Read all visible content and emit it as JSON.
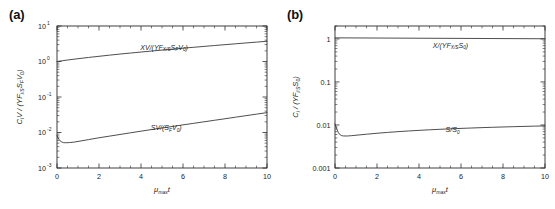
{
  "figure": {
    "panels": [
      {
        "id": "a",
        "label": "(a)",
        "xlabel_main": "μ",
        "xlabel_sub": "max",
        "xlabel_tail": "t",
        "ylabel": "C V / (YF   S V )",
        "xticks": [
          "0",
          "2",
          "4",
          "6",
          "8",
          "10"
        ],
        "yticks": [
          "10",
          "10",
          "10",
          "10",
          "10"
        ],
        "ytick_exponents": [
          "1",
          "0",
          "-1",
          "-2",
          "-3"
        ],
        "curve_labels": [
          "XV/(YF",
          "SV/(S"
        ]
      },
      {
        "id": "b",
        "label": "(b)",
        "xlabel_main": "μ",
        "xlabel_sub": "max",
        "xlabel_tail": "t",
        "ylabel": "C / (YF   S )",
        "xticks": [
          "0",
          "2",
          "4",
          "6",
          "8",
          "10"
        ],
        "yticks": [
          "1",
          "0.1",
          "0.01",
          "0.001"
        ],
        "curve_labels": [
          "X/(YF",
          "S/S"
        ]
      }
    ]
  },
  "chart_data": [
    {
      "type": "line",
      "panel": "a",
      "title": "(a)",
      "xlabel": "μ_max t",
      "ylabel": "C_i V / (YF_i/S S_F V_0)",
      "xlim": [
        0,
        10
      ],
      "ylim": [
        0.001,
        10
      ],
      "yscale": "log",
      "xscale": "linear",
      "grid": false,
      "legend": "inline-annotations",
      "xticks": [
        0,
        2,
        4,
        6,
        8,
        10
      ],
      "yticks": [
        0.001,
        0.01,
        0.1,
        1,
        10
      ],
      "series": [
        {
          "name": "XV/(YF_X/S S_F V_0)",
          "label_x": 5.1,
          "label_y": 2.15,
          "x": [
            0,
            0.25,
            0.5,
            1,
            1.5,
            2,
            2.5,
            3,
            3.5,
            4,
            4.5,
            5,
            5.5,
            6,
            6.5,
            7,
            7.5,
            8,
            8.5,
            9,
            9.5,
            10
          ],
          "values": [
            1.0,
            1.05,
            1.1,
            1.2,
            1.3,
            1.4,
            1.51,
            1.62,
            1.73,
            1.85,
            1.97,
            2.1,
            2.23,
            2.37,
            2.51,
            2.66,
            2.82,
            2.98,
            3.15,
            3.33,
            3.52,
            3.72
          ]
        },
        {
          "name": "SV/(S_F V_0)",
          "label_x": 5.2,
          "label_y": 0.0118,
          "x": [
            0,
            0.05,
            0.1,
            0.15,
            0.2,
            0.3,
            0.4,
            0.6,
            0.8,
            1,
            1.5,
            2,
            2.5,
            3,
            3.5,
            4,
            4.5,
            5,
            5.5,
            6,
            6.5,
            7,
            7.5,
            8,
            8.5,
            9,
            9.5,
            10
          ],
          "values": [
            0.0082,
            0.0071,
            0.0063,
            0.0058,
            0.0055,
            0.0052,
            0.00515,
            0.0052,
            0.00535,
            0.0056,
            0.0063,
            0.0071,
            0.0079,
            0.0088,
            0.0098,
            0.0109,
            0.0121,
            0.0134,
            0.0148,
            0.0164,
            0.0181,
            0.02,
            0.0221,
            0.0244,
            0.027,
            0.0298,
            0.0329,
            0.0363
          ]
        }
      ]
    },
    {
      "type": "line",
      "panel": "b",
      "title": "(b)",
      "xlabel": "μ_max t",
      "ylabel": "C_i / (YF_i/S S_0)",
      "xlim": [
        0,
        10
      ],
      "ylim": [
        0.001,
        2
      ],
      "yscale": "log",
      "xscale": "linear",
      "grid": false,
      "legend": "inline-annotations",
      "xticks": [
        0,
        2,
        4,
        6,
        8,
        10
      ],
      "yticks": [
        0.001,
        0.01,
        0.1,
        1
      ],
      "series": [
        {
          "name": "X/(YF_X/S S_0)",
          "label_x": 5.5,
          "label_y": 0.62,
          "x": [
            0,
            1,
            2,
            3,
            4,
            5,
            6,
            7,
            8,
            9,
            10
          ],
          "values": [
            1.06,
            1.055,
            1.05,
            1.045,
            1.04,
            1.035,
            1.03,
            1.025,
            1.02,
            1.015,
            1.01
          ]
        },
        {
          "name": "S/S_0",
          "label_x": 5.6,
          "label_y": 0.0068,
          "x": [
            0,
            0.05,
            0.1,
            0.15,
            0.2,
            0.3,
            0.4,
            0.6,
            0.8,
            1,
            1.5,
            2,
            2.5,
            3,
            3.5,
            4,
            4.5,
            5,
            5.5,
            6,
            6.5,
            7,
            7.5,
            8,
            8.5,
            9,
            9.5,
            10
          ],
          "values": [
            0.0105,
            0.009,
            0.0078,
            0.0068,
            0.0062,
            0.0057,
            0.00555,
            0.00555,
            0.00565,
            0.00578,
            0.0061,
            0.00642,
            0.00672,
            0.007,
            0.00726,
            0.0075,
            0.00773,
            0.00794,
            0.00814,
            0.00833,
            0.00851,
            0.00868,
            0.00884,
            0.00899,
            0.00913,
            0.00927,
            0.0094,
            0.00952
          ]
        }
      ]
    }
  ]
}
